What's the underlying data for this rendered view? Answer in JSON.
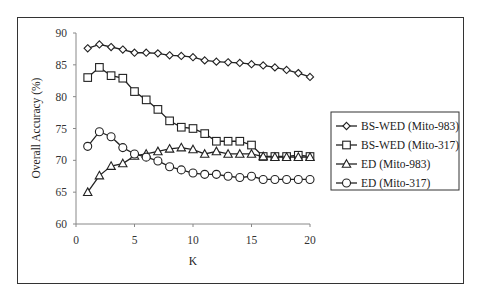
{
  "chart_data": {
    "type": "line",
    "title": "",
    "xlabel": "K",
    "ylabel": "Overall Accuracy (%)",
    "xlim": [
      0,
      20
    ],
    "ylim": [
      60,
      90
    ],
    "xticks": [
      0,
      5,
      10,
      15,
      20
    ],
    "yticks": [
      60,
      65,
      70,
      75,
      80,
      85,
      90
    ],
    "grid": false,
    "legend_position": "right",
    "x": [
      1,
      2,
      3,
      4,
      5,
      6,
      7,
      8,
      9,
      10,
      11,
      12,
      13,
      14,
      15,
      16,
      17,
      18,
      19,
      20
    ],
    "series": [
      {
        "name": "BS-WED (Mito-983)",
        "marker": "diamond",
        "values": [
          87.6,
          88.2,
          87.8,
          87.4,
          86.9,
          86.9,
          86.8,
          86.5,
          86.4,
          86.2,
          85.7,
          85.5,
          85.4,
          85.3,
          85.1,
          84.9,
          84.6,
          84.2,
          83.7,
          83.1
        ]
      },
      {
        "name": "BS-WED (Mito-317)",
        "marker": "square",
        "values": [
          83.0,
          84.6,
          83.3,
          82.9,
          80.8,
          79.5,
          78.0,
          76.2,
          75.2,
          75.0,
          74.2,
          73.0,
          73.0,
          73.0,
          72.4,
          70.6,
          70.6,
          70.6,
          70.8,
          70.6
        ]
      },
      {
        "name": "ED (Mito-983)",
        "marker": "triangle",
        "values": [
          65.0,
          67.6,
          69.1,
          69.5,
          70.7,
          71.0,
          71.4,
          71.8,
          72.0,
          71.7,
          71.0,
          71.4,
          71.0,
          71.0,
          71.0,
          70.6,
          70.5,
          70.5,
          70.5,
          70.5
        ]
      },
      {
        "name": "ED (Mito-317)",
        "marker": "circle",
        "values": [
          72.2,
          74.5,
          73.7,
          72.0,
          71.0,
          70.5,
          69.9,
          69.0,
          68.5,
          68.0,
          67.8,
          67.8,
          67.5,
          67.3,
          67.5,
          67.0,
          67.0,
          67.0,
          67.0,
          67.0
        ]
      }
    ]
  }
}
